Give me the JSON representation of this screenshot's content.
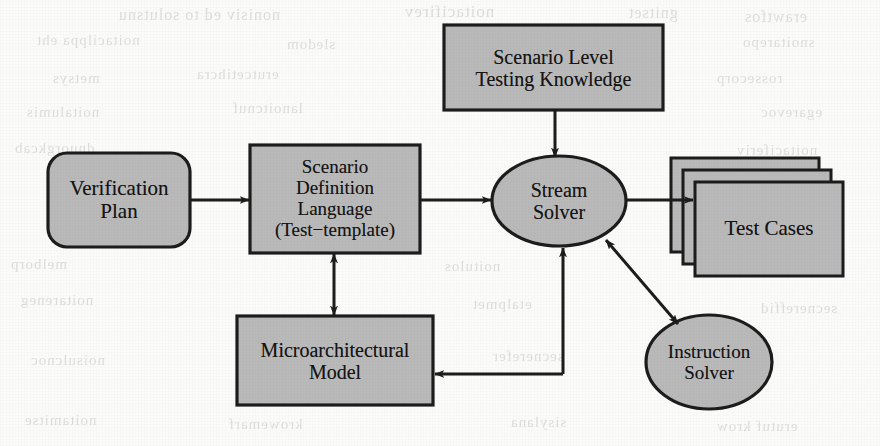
{
  "figure": {
    "kind": "flow-diagram",
    "fill_color": "#b9b9b9",
    "stroke_color": "#1d1d1d",
    "background_color": "#fbfbfa",
    "text_color": "#141414"
  },
  "nodes": {
    "verification_plan": {
      "shape": "rounded-rectangle",
      "lines": [
        "Verification",
        "Plan"
      ],
      "x": 48,
      "y": 153,
      "w": 142,
      "h": 94,
      "r": 18,
      "font_size": 21
    },
    "scenario_definition_language": {
      "shape": "rectangle",
      "lines": [
        "Scenario",
        "Definition",
        "Language",
        "(Test−template)"
      ],
      "x": 250,
      "y": 145,
      "w": 170,
      "h": 108,
      "font_size": 19
    },
    "scenario_level_testing_knowledge": {
      "shape": "rectangle",
      "lines": [
        "Scenario Level",
        "Testing Knowledge"
      ],
      "x": 444,
      "y": 25,
      "w": 219,
      "h": 85,
      "font_size": 20
    },
    "stream_solver": {
      "shape": "ellipse",
      "lines": [
        "Stream",
        "Solver"
      ],
      "x": 492,
      "y": 156,
      "w": 134,
      "h": 90,
      "font_size": 20
    },
    "test_cases": {
      "shape": "stacked-rectangles",
      "lines": [
        "Test Cases"
      ],
      "x": 671,
      "y": 158,
      "w": 148,
      "h": 94,
      "stack_count": 3,
      "stack_offset_x": 12,
      "stack_offset_y": 12,
      "font_size": 21
    },
    "microarchitectural_model": {
      "shape": "rectangle",
      "lines": [
        "Microarchitectural",
        "Model"
      ],
      "x": 237,
      "y": 316,
      "w": 196,
      "h": 89,
      "font_size": 20
    },
    "instruction_solver": {
      "shape": "ellipse",
      "lines": [
        "Instruction",
        "Solver"
      ],
      "x": 646,
      "y": 316,
      "w": 126,
      "h": 93,
      "font_size": 19
    }
  },
  "edges": [
    {
      "id": "plan-to-sdl",
      "from": "verification_plan",
      "to": "scenario_definition_language",
      "style": "straight-horizontal",
      "arrowheads": "end"
    },
    {
      "id": "sdl-to-stream",
      "from": "scenario_definition_language",
      "to": "stream_solver",
      "style": "straight-horizontal",
      "arrowheads": "end"
    },
    {
      "id": "knowledge-to-stream",
      "from": "scenario_level_testing_knowledge",
      "to": "stream_solver",
      "style": "straight-vertical",
      "arrowheads": "end"
    },
    {
      "id": "stream-to-testcases",
      "from": "stream_solver",
      "to": "test_cases",
      "style": "straight-horizontal",
      "arrowheads": "end"
    },
    {
      "id": "sdl-model-bidirectional",
      "from": "scenario_definition_language",
      "to": "microarchitectural_model",
      "style": "straight-vertical",
      "arrowheads": "both"
    },
    {
      "id": "stream-instruction-bidirectional",
      "from": "stream_solver",
      "to": "instruction_solver",
      "style": "diagonal",
      "arrowheads": "both"
    },
    {
      "id": "stream-to-model",
      "from": "stream_solver",
      "to": "microarchitectural_model",
      "style": "elbow-down-left",
      "arrowheads": "end"
    }
  ],
  "bleed_through_text": [
    {
      "text": "nonisiv ed to solutsnu",
      "x": 118,
      "y": 6,
      "size": 16
    },
    {
      "text": "noitacifirev",
      "x": 404,
      "y": 2,
      "size": 17
    },
    {
      "text": "gnitset",
      "x": 628,
      "y": 4,
      "size": 16
    },
    {
      "text": "erawtfos",
      "x": 744,
      "y": 8,
      "size": 16
    },
    {
      "text": "noitacilppa eht",
      "x": 36,
      "y": 32,
      "size": 15
    },
    {
      "text": "sledom",
      "x": 286,
      "y": 36,
      "size": 15
    },
    {
      "text": "gnireenigne",
      "x": 534,
      "y": 40,
      "size": 15
    },
    {
      "text": "snoitarepo",
      "x": 742,
      "y": 34,
      "size": 15
    },
    {
      "text": "metsys",
      "x": 52,
      "y": 70,
      "size": 15
    },
    {
      "text": "erutcetihcra",
      "x": 196,
      "y": 66,
      "size": 15
    },
    {
      "text": "rossecorp",
      "x": 716,
      "y": 70,
      "size": 15
    },
    {
      "text": "noitalumis",
      "x": 26,
      "y": 104,
      "size": 15
    },
    {
      "text": "lanoitcnuf",
      "x": 232,
      "y": 100,
      "size": 15
    },
    {
      "text": "egarevoc",
      "x": 760,
      "y": 104,
      "size": 15
    },
    {
      "text": "dnuorgkcab",
      "x": 14,
      "y": 140,
      "size": 15
    },
    {
      "text": "noitaciferiv",
      "x": 736,
      "y": 142,
      "size": 15
    },
    {
      "text": "melborp",
      "x": 10,
      "y": 256,
      "size": 15
    },
    {
      "text": "noitulos",
      "x": 444,
      "y": 258,
      "size": 15
    },
    {
      "text": "stluser",
      "x": 778,
      "y": 254,
      "size": 15
    },
    {
      "text": "noitareneg",
      "x": 20,
      "y": 292,
      "size": 15
    },
    {
      "text": "etalpmet",
      "x": 472,
      "y": 296,
      "size": 15
    },
    {
      "text": "secnereffid",
      "x": 760,
      "y": 300,
      "size": 15
    },
    {
      "text": "noisulcnoc",
      "x": 30,
      "y": 352,
      "size": 15
    },
    {
      "text": "secnerefer",
      "x": 492,
      "y": 348,
      "size": 15
    },
    {
      "text": "noitamitse",
      "x": 24,
      "y": 412,
      "size": 15
    },
    {
      "text": "krowemarf",
      "x": 228,
      "y": 416,
      "size": 15
    },
    {
      "text": "sisylana",
      "x": 510,
      "y": 414,
      "size": 15
    },
    {
      "text": "erutuf krow",
      "x": 716,
      "y": 418,
      "size": 15
    }
  ]
}
